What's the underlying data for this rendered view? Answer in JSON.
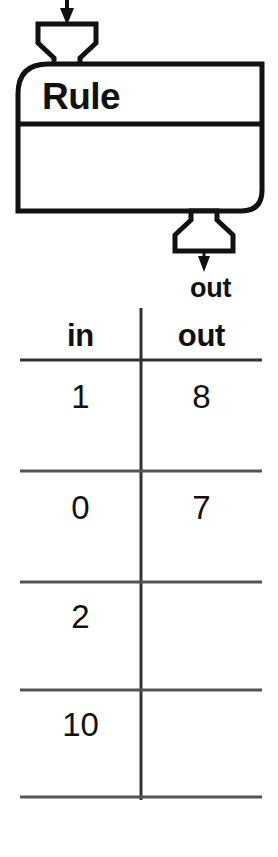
{
  "diagram": {
    "type": "function-machine",
    "machine_label": "Rule",
    "input_arrow_label": "",
    "output_arrow_label": "out",
    "input_port": "top-left",
    "output_port": "bottom-right"
  },
  "table": {
    "headers": [
      "in",
      "out"
    ],
    "rows": [
      {
        "in": "1",
        "out": "8"
      },
      {
        "in": "0",
        "out": "7"
      },
      {
        "in": "2",
        "out": ""
      },
      {
        "in": "10",
        "out": ""
      }
    ]
  },
  "colors": {
    "ink": "#111111",
    "paper": "#ffffff",
    "rule_line": "#555555"
  }
}
